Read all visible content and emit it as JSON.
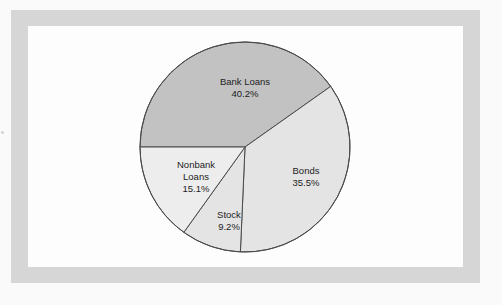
{
  "figure": {
    "frame_color": "#d6d6d6",
    "background_color": "#fdfdfd",
    "outline_color": "#4a4a4a"
  },
  "chart_data": {
    "type": "pie",
    "title": "",
    "subtitle": "",
    "xlabel": "",
    "ylabel": "",
    "grid": false,
    "legend_position": "none",
    "label_style": "inside-slice",
    "units": "percent",
    "total": 100.0,
    "center": {
      "x": 245,
      "y": 147
    },
    "radius": 105,
    "start_angle_deg": 180,
    "direction": "clockwise",
    "categories": [
      "Bank Loans",
      "Bonds",
      "Stock",
      "Nonbank Loans"
    ],
    "values": [
      40.2,
      35.5,
      9.2,
      15.1
    ],
    "value_labels": [
      "40.2%",
      "35.5%",
      "9.2%",
      "15.1%"
    ],
    "colors": [
      "#c2c2c2",
      "#e4e4e4",
      "#e4e4e4",
      "#ededed"
    ],
    "slices": [
      {
        "name": "Bank Loans",
        "label_lines": [
          "Bank Loans",
          "40.2%"
        ],
        "value": 40.2,
        "value_label": "40.2%",
        "color": "#c2c2c2",
        "start_angle_deg": 180,
        "end_angle_deg": 324.72,
        "sweep_deg": 144.72,
        "label_x": 245,
        "label_y": 88
      },
      {
        "name": "Bonds",
        "label_lines": [
          "Bonds",
          "35.5%"
        ],
        "value": 35.5,
        "value_label": "35.5%",
        "color": "#e4e4e4",
        "start_angle_deg": 324.72,
        "end_angle_deg": 452.52,
        "sweep_deg": 127.8,
        "label_x": 306,
        "label_y": 177
      },
      {
        "name": "Stock",
        "label_lines": [
          "Stock",
          "9.2%"
        ],
        "value": 9.2,
        "value_label": "9.2%",
        "color": "#e4e4e4",
        "start_angle_deg": 452.52,
        "end_angle_deg": 485.64,
        "sweep_deg": 33.12,
        "label_x": 229,
        "label_y": 221
      },
      {
        "name": "Nonbank Loans",
        "label_lines": [
          "Nonbank",
          "Loans",
          "15.1%"
        ],
        "value": 15.1,
        "value_label": "15.1%",
        "color": "#ededed",
        "start_angle_deg": 485.64,
        "end_angle_deg": 540,
        "sweep_deg": 54.36,
        "label_x": 196,
        "label_y": 177
      }
    ]
  }
}
